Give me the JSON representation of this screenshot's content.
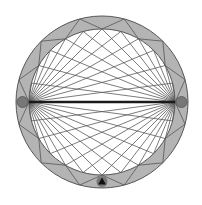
{
  "diagram": {
    "type": "circular-chord-diagram",
    "center": [
      102,
      102
    ],
    "outer_radius": 86,
    "inner_radius": 73,
    "anchors": [
      {
        "name": "left-anchor",
        "angle_deg": 180
      },
      {
        "name": "right-anchor",
        "angle_deg": 0
      }
    ],
    "inner_point_angles_deg": [
      15,
      30,
      45,
      60,
      75,
      90,
      105,
      120,
      135,
      150,
      165,
      195,
      210,
      225,
      240,
      255,
      270,
      285,
      300,
      315,
      330,
      345
    ],
    "ring_zigzag_inner_angles_deg": [
      0,
      30,
      60,
      90,
      120,
      150,
      180,
      210,
      240,
      270,
      300,
      330
    ],
    "ring_zigzag_outer_angles_deg": [
      15,
      45,
      75,
      105,
      135,
      165,
      195,
      225,
      255,
      285,
      315,
      345
    ],
    "colors": {
      "ring_fill": "#b4b4b4",
      "ring_stroke": "#555555",
      "chord": "#5a5a5a",
      "diameter": "#1a1a1a",
      "marker": "#777777",
      "marker_triangle": "#111111"
    },
    "bottom_marker": {
      "angle_deg": 270,
      "symbol": "triangle"
    }
  }
}
